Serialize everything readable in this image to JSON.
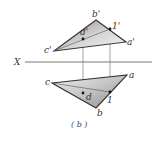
{
  "figure": {
    "caption": "( b )",
    "axis_label": "X",
    "colors": {
      "line": "#333333",
      "fill_dark": "#9a9a9a",
      "fill_light": "#f2f2f2",
      "projector": "#555555"
    }
  },
  "front_view": {
    "vertices": {
      "b": {
        "label": "b'",
        "x": 96,
        "y": 20
      },
      "a": {
        "label": "a'",
        "x": 126,
        "y": 42
      },
      "c": {
        "label": "c'",
        "x": 54,
        "y": 51
      }
    },
    "points": {
      "one": {
        "label": "1'",
        "x": 110,
        "y": 29
      },
      "d": {
        "label": "d'",
        "x": 83,
        "y": 39
      }
    }
  },
  "top_view": {
    "vertices": {
      "c": {
        "label": "c",
        "x": 52,
        "y": 83
      },
      "a": {
        "label": "a",
        "x": 127,
        "y": 75
      },
      "b": {
        "label": "b",
        "x": 96,
        "y": 108
      }
    },
    "points": {
      "one": {
        "label": "1",
        "x": 110,
        "y": 92
      },
      "d": {
        "label": "d",
        "x": 83,
        "y": 93
      }
    }
  }
}
